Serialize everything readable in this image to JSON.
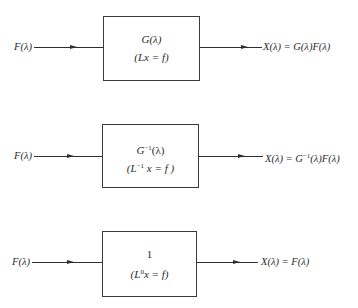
{
  "diagram": {
    "type": "block-diagram",
    "stages": [
      {
        "input_label": "F(λ)",
        "block": {
          "transfer": "G(λ)",
          "equation": "(Lx = f)"
        },
        "output_label": "X(λ) = G(λ)F(λ)"
      },
      {
        "input_label": "F(λ)",
        "block": {
          "transfer_base": "G",
          "transfer_sup": "−1",
          "transfer_arg": "(λ)",
          "equation_open": "(L",
          "equation_sup": "−1",
          "equation_rest": " x = f )"
        },
        "output_prefix": "X(λ) = G",
        "output_sup": "−1",
        "output_suffix": "(λ)F(λ)"
      },
      {
        "input_label": "F(λ)",
        "block": {
          "transfer": "1",
          "equation_open": "(L",
          "equation_sup": "0",
          "equation_rest": "x = f)"
        },
        "output_label": "X(λ) = F(λ)"
      }
    ],
    "colors": {
      "line": "#2e2e2e",
      "text": "#2a2a2a",
      "background": "#ffffff"
    }
  }
}
